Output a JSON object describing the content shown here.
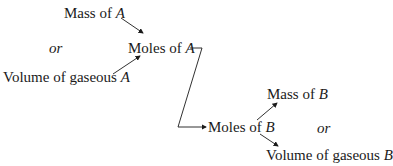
{
  "diagram": {
    "nodes": {
      "mass_a": {
        "text": "Mass of ",
        "var": "A"
      },
      "or_a": "or",
      "volume_a": {
        "text": "Volume of gaseous ",
        "var": "A"
      },
      "moles_a": {
        "text": "Moles of ",
        "var": "A"
      },
      "moles_b": {
        "text": "Moles of ",
        "var": "B"
      },
      "mass_b": {
        "text": "Mass of ",
        "var": "B"
      },
      "or_b": "or",
      "volume_b": {
        "text": "Volume of gaseous ",
        "var": "B"
      }
    },
    "edges": [
      {
        "from": "Mass of A",
        "to": "Moles of A"
      },
      {
        "from": "Volume of gaseous A",
        "to": "Moles of A"
      },
      {
        "from": "Moles of A",
        "to": "Moles of B"
      },
      {
        "from": "Moles of B",
        "to": "Mass of B"
      },
      {
        "from": "Moles of B",
        "to": "Volume of gaseous B"
      }
    ]
  }
}
